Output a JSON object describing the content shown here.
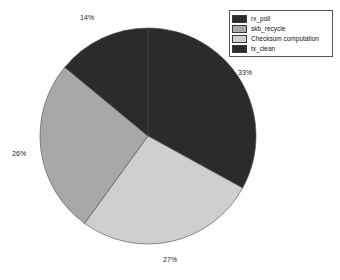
{
  "chart_data": {
    "type": "pie",
    "title": "",
    "labels": [
      "rx_poll",
      "skb_recycle",
      "Checksum computation",
      "tx_clean"
    ],
    "values": [
      33,
      26,
      27,
      14
    ],
    "value_labels": [
      "33%",
      "26%",
      "27%",
      "14%"
    ],
    "colors": [
      "#2b2b2b",
      "#a8a8a8",
      "#cfcfcf",
      "#2b2b2b"
    ],
    "slice_order_clockwise_from_top": [
      "rx_poll",
      "Checksum computation",
      "skb_recycle",
      "tx_clean"
    ],
    "legend_position": "top-right",
    "grid": false,
    "xlabel": "",
    "ylabel": ""
  },
  "legend": {
    "entries": [
      {
        "label": "rx_poll",
        "color": "#2b2b2b"
      },
      {
        "label": "skb_recycle",
        "color": "#a8a8a8"
      },
      {
        "label": "Checksum computation",
        "color": "#cfcfcf"
      },
      {
        "label": "tx_clean",
        "color": "#2b2b2b"
      }
    ]
  },
  "labels": {
    "top": "14%",
    "right": "33%",
    "bottom": "27%",
    "left": "26%"
  }
}
